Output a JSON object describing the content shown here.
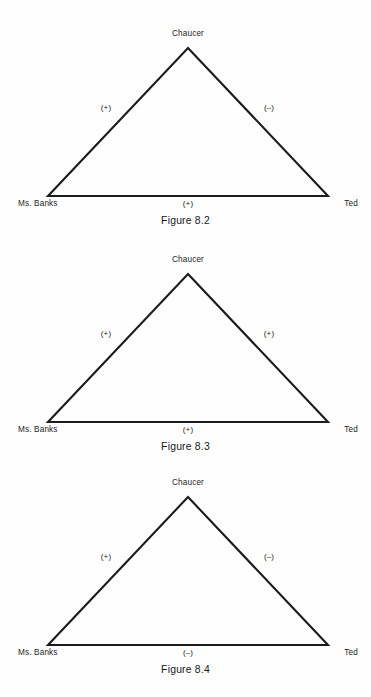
{
  "page": {
    "background_color": "#fefefe",
    "line_color": "#1c1c1c",
    "text_color": "#1a1a1a"
  },
  "figures": [
    {
      "id": "figure-8-2",
      "caption": "Figure 8.2",
      "nodes": {
        "apex": "Chaucer",
        "left": "Ms. Banks",
        "right": "Ted"
      },
      "edges": {
        "left_sign": "(+)",
        "right_sign": "(–)",
        "bottom_sign": "(+)"
      }
    },
    {
      "id": "figure-8-3",
      "caption": "Figure 8.3",
      "nodes": {
        "apex": "Chaucer",
        "left": "Ms. Banks",
        "right": "Ted"
      },
      "edges": {
        "left_sign": "(+)",
        "right_sign": "(+)",
        "bottom_sign": "(+)"
      }
    },
    {
      "id": "figure-8-4",
      "caption": "Figure 8.4",
      "nodes": {
        "apex": "Chaucer",
        "left": "Ms. Banks",
        "right": "Ted"
      },
      "edges": {
        "left_sign": "(+)",
        "right_sign": "(–)",
        "bottom_sign": "(–)"
      }
    }
  ]
}
